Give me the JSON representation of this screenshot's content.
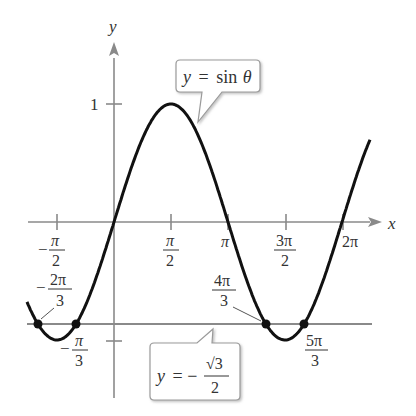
{
  "chart_data": {
    "type": "line",
    "title": "",
    "xlabel": "x",
    "ylabel": "y",
    "xlim": [
      -2.4,
      7.0
    ],
    "ylim": [
      -1.1,
      1.5
    ],
    "grid": false,
    "x_ticks": [
      {
        "value": -1.5708,
        "label": "-π/2"
      },
      {
        "value": 1.5708,
        "label": "π/2"
      },
      {
        "value": 3.1416,
        "label": "π"
      },
      {
        "value": 4.7124,
        "label": "3π/2"
      },
      {
        "value": 6.2832,
        "label": "2π"
      }
    ],
    "y_ticks": [
      {
        "value": 1,
        "label": "1"
      },
      {
        "value": -0.866,
        "label": ""
      }
    ],
    "series": [
      {
        "name": "y = sin θ",
        "function": "sin",
        "domain": [
          -2.4,
          6.8
        ],
        "color": "#111111"
      },
      {
        "name": "y = -√3/2",
        "function": "constant",
        "value": -0.866,
        "color": "#888888"
      }
    ],
    "points": [
      {
        "x": -2.0944,
        "y": -0.866,
        "label": "-2π/3"
      },
      {
        "x": -1.0472,
        "y": -0.866,
        "label": "-π/3"
      },
      {
        "x": 4.1888,
        "y": -0.866,
        "label": "4π/3"
      },
      {
        "x": 5.236,
        "y": -0.866,
        "label": "5π/3"
      }
    ],
    "annotations": [
      {
        "text": "y = sin θ",
        "type": "callout"
      },
      {
        "text": "y = -√3/2",
        "type": "callout"
      }
    ]
  },
  "labels": {
    "x_axis": "x",
    "y_axis": "y",
    "y_tick_1": "1",
    "callout_sin": {
      "y": "y",
      "eq": "=",
      "fn": "sin",
      "theta": "θ"
    },
    "callout_line": {
      "y": "y",
      "eq": "= −",
      "num": "√3",
      "den": "2"
    },
    "ticks": {
      "neg_pi_2": {
        "sign": "−",
        "num": "π",
        "den": "2"
      },
      "pi_2": {
        "num": "π",
        "den": "2"
      },
      "pi": "π",
      "three_pi_2": {
        "num": "3π",
        "den": "2"
      },
      "two_pi": "2π"
    },
    "points": {
      "neg_2pi_3": {
        "sign": "−",
        "num": "2π",
        "den": "3"
      },
      "neg_pi_3": {
        "sign": "−",
        "num": "π",
        "den": "3"
      },
      "four_pi_3": {
        "num": "4π",
        "den": "3"
      },
      "five_pi_3": {
        "num": "5π",
        "den": "3"
      }
    }
  }
}
